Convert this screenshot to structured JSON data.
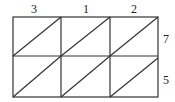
{
  "diagram": {
    "type": "lattice-multiplication-grid",
    "top_digits": [
      "3",
      "1",
      "2"
    ],
    "right_digits": [
      "7",
      "5"
    ],
    "columns": 3,
    "rows": 2,
    "cell_diagonals": "bottom-left to top-right"
  }
}
